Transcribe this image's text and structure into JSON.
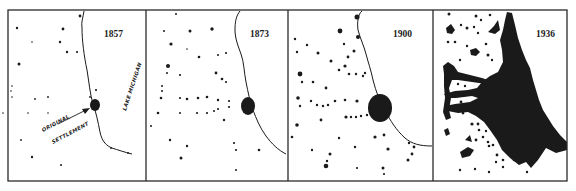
{
  "figure": {
    "background": "#ffffff",
    "ink": "#1a1a1a",
    "frame": {
      "x": 8,
      "y": 10,
      "w": 559,
      "h": 171
    },
    "dividers_x": [
      146,
      288,
      433
    ]
  },
  "panels": [
    {
      "year": "1857",
      "year_pos": [
        104,
        37
      ],
      "offset_x": 8,
      "labels": {
        "lake": "LAKE MICHIGAN",
        "settlement_line1": "ORIGINAL",
        "settlement_line2": "SETTLEMENT"
      },
      "core": [
        [
          95,
          105,
          5,
          6
        ]
      ],
      "dots": [
        [
          80,
          16,
          1.4
        ],
        [
          17,
          28,
          1.2
        ],
        [
          63,
          29,
          1.4
        ],
        [
          32,
          42,
          0.8
        ],
        [
          60,
          42,
          1.2
        ],
        [
          67,
          52,
          1.2
        ],
        [
          77,
          52,
          1.1
        ],
        [
          19,
          64,
          1.5
        ],
        [
          12,
          86,
          0.8
        ],
        [
          11,
          91,
          0.8
        ],
        [
          12,
          97,
          0.8
        ],
        [
          35,
          99,
          0.9
        ],
        [
          48,
          97,
          0.9
        ],
        [
          28,
          113,
          0.8
        ],
        [
          48,
          113,
          0.8
        ],
        [
          90,
          97,
          0.9
        ],
        [
          96,
          90,
          1.1
        ],
        [
          21,
          140,
          0.9
        ],
        [
          32,
          157,
          1.2
        ],
        [
          61,
          165,
          1.0
        ],
        [
          111,
          148,
          0.9
        ],
        [
          128,
          153,
          0.9
        ],
        [
          3,
          113,
          0.8
        ]
      ]
    },
    {
      "year": "1873",
      "year_pos": [
        250,
        37
      ],
      "offset_x": 146,
      "core": [
        [
          248,
          106,
          7,
          9
        ]
      ],
      "dots": [
        [
          176,
          14,
          1
        ],
        [
          164,
          31,
          1
        ],
        [
          190,
          31,
          1.5
        ],
        [
          212,
          29,
          1.7
        ],
        [
          171,
          44,
          1.6
        ],
        [
          187,
          49,
          0.8
        ],
        [
          199,
          57,
          1.3
        ],
        [
          218,
          55,
          1
        ],
        [
          226,
          53,
          1.1
        ],
        [
          168,
          66,
          2
        ],
        [
          167,
          73,
          1
        ],
        [
          180,
          75,
          1.1
        ],
        [
          216,
          73,
          1.4
        ],
        [
          222,
          79,
          1.3
        ],
        [
          226,
          82,
          1.1
        ],
        [
          162,
          86,
          1
        ],
        [
          162,
          91,
          1
        ],
        [
          161,
          98,
          1.3
        ],
        [
          180,
          98,
          1.1
        ],
        [
          187,
          99,
          1.3
        ],
        [
          198,
          98,
          1.3
        ],
        [
          207,
          97,
          1.3
        ],
        [
          218,
          100,
          1.2
        ],
        [
          229,
          101,
          1.1
        ],
        [
          218,
          109,
          1.1
        ],
        [
          229,
          107,
          1.1
        ],
        [
          158,
          113,
          1.3
        ],
        [
          180,
          113,
          1
        ],
        [
          197,
          113,
          1.1
        ],
        [
          207,
          113,
          1.1
        ],
        [
          214,
          111,
          1
        ],
        [
          224,
          120,
          1.2
        ],
        [
          151,
          126,
          1
        ],
        [
          170,
          140,
          1.2
        ],
        [
          187,
          146,
          1.2
        ],
        [
          181,
          158,
          1.5
        ],
        [
          234,
          143,
          1.1
        ],
        [
          236,
          150,
          1.1
        ],
        [
          259,
          150,
          1.3
        ],
        [
          236,
          170,
          1
        ]
      ]
    },
    {
      "year": "1900",
      "year_pos": [
        395,
        37
      ],
      "offset_x": 288,
      "core": [
        [
          380,
          108,
          12,
          14
        ]
      ],
      "dots": [
        [
          357,
          17,
          2.5
        ],
        [
          340,
          31,
          2.4
        ],
        [
          358,
          37,
          2
        ],
        [
          295,
          39,
          1.2
        ],
        [
          307,
          45,
          1.2
        ],
        [
          297,
          52,
          1.2
        ],
        [
          318,
          53,
          1.5
        ],
        [
          344,
          44,
          1.2
        ],
        [
          354,
          51,
          1.5
        ],
        [
          348,
          57,
          1.4
        ],
        [
          331,
          61,
          1.5
        ],
        [
          345,
          66,
          1.6
        ],
        [
          339,
          70,
          1.3
        ],
        [
          349,
          74,
          1.3
        ],
        [
          356,
          74,
          1.2
        ],
        [
          363,
          76,
          1.2
        ],
        [
          365,
          73,
          1.2
        ],
        [
          300,
          74,
          2.4
        ],
        [
          302,
          82,
          1.2
        ],
        [
          313,
          82,
          1.3
        ],
        [
          326,
          88,
          1.4
        ],
        [
          298,
          98,
          1.8
        ],
        [
          300,
          106,
          1.2
        ],
        [
          311,
          101,
          1.2
        ],
        [
          317,
          105,
          1.2
        ],
        [
          323,
          106,
          1.2
        ],
        [
          328,
          105,
          1.2
        ],
        [
          335,
          101,
          1.3
        ],
        [
          345,
          100,
          1.3
        ],
        [
          357,
          101,
          1.6
        ],
        [
          346,
          117,
          1.6
        ],
        [
          351,
          117,
          1.2
        ],
        [
          356,
          117,
          1.2
        ],
        [
          361,
          116,
          1.2
        ],
        [
          367,
          115,
          1.2
        ],
        [
          372,
          114,
          1.2
        ],
        [
          377,
          112,
          1.2
        ],
        [
          321,
          120,
          1.4
        ],
        [
          297,
          125,
          1.8
        ],
        [
          292,
          137,
          1.3
        ],
        [
          339,
          138,
          1.2
        ],
        [
          375,
          137,
          1.6
        ],
        [
          384,
          135,
          1.4
        ],
        [
          388,
          149,
          1.6
        ],
        [
          355,
          147,
          1.2
        ],
        [
          312,
          150,
          1.2
        ],
        [
          330,
          154,
          1.5
        ],
        [
          327,
          161,
          1.2
        ],
        [
          326,
          166,
          2.3
        ],
        [
          357,
          168,
          1.1
        ],
        [
          383,
          168,
          1.5
        ],
        [
          384,
          174,
          1.1
        ],
        [
          412,
          154,
          1.4
        ],
        [
          408,
          160,
          1.5
        ],
        [
          414,
          147,
          1.4
        ],
        [
          409,
          143,
          1.2
        ]
      ]
    },
    {
      "year": "1936",
      "year_pos": [
        536,
        37
      ],
      "offset_x": 433
    }
  ],
  "panel_1936_blobs": {
    "main_metro": "M507,12 L512,13 L515,25 L518,38 L522,50 L526,60 L530,68 L533,80 L536,90 L539,100 L543,110 L548,118 L553,126 L560,135 L567,142 L567,150 L556,153 L546,148 L538,160 L531,168 L526,162 L519,165 L510,158 L502,150 L497,140 L490,130 L484,122 L476,116 L468,112 L458,113 L448,111 L445,106 L455,104 L470,102 L478,98 L472,96 L456,98 L447,98 L444,94 L455,91 L468,90 L477,88 L482,82 L490,76 L498,72 L503,62 L502,50 L500,40 L503,30 L505,20 Z",
    "arms": [
      "M443,66 L448,62 L454,66 L458,72 L470,75 L482,78 L488,80 L486,84 L472,82 L458,80 L452,80 L449,88 L451,98 L449,110 L451,118 L446,120 L443,112 L445,98 L444,86 L444,74 Z",
      "M446,28 L451,24 L455,30 L452,34 L447,33 Z",
      "M488,32 L494,26 L498,20 L500,30 L495,34 Z",
      "M470,50 L476,48 L480,52 L476,56 L471,55 Z",
      "M493,118 L500,114 L506,118 L502,124 L495,124 Z",
      "M460,152 L468,147 L474,150 L470,156 L462,158 Z",
      "M444,130 L448,128 L450,134 L446,136 Z",
      "M465,140 L470,135 L472,142 Z"
    ],
    "specks": [
      [
        449,
        14,
        1.5
      ],
      [
        476,
        16,
        1.5
      ],
      [
        481,
        20,
        1.2
      ],
      [
        490,
        15,
        1.3
      ],
      [
        461,
        25,
        1.2
      ],
      [
        467,
        28,
        1.5
      ],
      [
        474,
        27,
        1.2
      ],
      [
        478,
        33,
        1.2
      ],
      [
        448,
        42,
        1.3
      ],
      [
        455,
        42,
        1.3
      ],
      [
        467,
        46,
        1.2
      ],
      [
        460,
        60,
        1.2
      ],
      [
        486,
        44,
        1.3
      ],
      [
        488,
        55,
        1.5
      ],
      [
        492,
        60,
        1.2
      ],
      [
        458,
        84,
        1.2
      ],
      [
        465,
        86,
        1.2
      ],
      [
        478,
        92,
        1.3
      ],
      [
        461,
        102,
        1.4
      ],
      [
        463,
        113,
        1.4
      ],
      [
        472,
        124,
        1.6
      ],
      [
        478,
        124,
        1.4
      ],
      [
        479,
        130,
        1.3
      ],
      [
        486,
        131,
        1.2
      ],
      [
        483,
        137,
        1.3
      ],
      [
        476,
        140,
        1.4
      ],
      [
        488,
        142,
        1.3
      ],
      [
        489,
        146,
        1.3
      ],
      [
        493,
        145,
        1.3
      ],
      [
        497,
        155,
        1.4
      ],
      [
        503,
        160,
        1.3
      ],
      [
        514,
        160,
        1.3
      ],
      [
        496,
        162,
        1.2
      ],
      [
        475,
        169,
        1.2
      ],
      [
        489,
        172,
        1.2
      ],
      [
        503,
        167,
        1.2
      ],
      [
        527,
        172,
        1.2
      ],
      [
        460,
        170,
        1.2
      ]
    ]
  },
  "coastlines": [
    "M84,11 C83,18 81,22 82,28 C82,40 84,56 87,70 C89,82 90,94 93,104 C96,112 98,122 100,132 C102,142 107,146 112,148 C118,150 124,152 132,154",
    "M240,11 C236,16 235,22 235,30 C235,38 238,46 241,54 C244,62 244,72 246,82 C248,92 250,102 253,110 C256,118 260,128 266,136 C272,144 278,150 286,154",
    "M362,11 C358,14 357,22 358,30 C360,38 364,46 366,54 C368,62 371,70 373,80 C376,92 380,102 386,112 C390,120 396,130 405,138 C412,144 420,146 432,146"
  ]
}
